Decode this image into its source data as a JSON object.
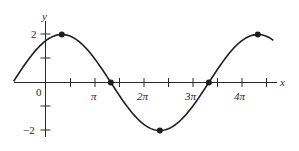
{
  "chart_data": {
    "type": "line",
    "title": "",
    "function": "y = 2 sin(x/2 + π/3)",
    "xlabel": "x",
    "ylabel": "y",
    "xlim": [
      -0.65,
      4.65
    ],
    "xlim_units": "multiples of π",
    "ylim": [
      -2.2,
      2.5
    ],
    "x_ticks": [
      0.5,
      1,
      1.5,
      2,
      2.5,
      3,
      3.5,
      4,
      4.5
    ],
    "x_tick_labels": [
      {
        "value": 0,
        "label": "0"
      },
      {
        "value": 1,
        "label": "π"
      },
      {
        "value": 2,
        "label": "2π"
      },
      {
        "value": 3,
        "label": "3π"
      },
      {
        "value": 4,
        "label": "4π"
      }
    ],
    "y_ticks": [
      -2,
      -1,
      1,
      2
    ],
    "y_tick_labels": [
      {
        "value": 2,
        "label": "2"
      },
      {
        "value": -2,
        "label": "−2"
      }
    ],
    "marked_points": [
      {
        "x_pi": 0.3333,
        "y": 2,
        "kind": "maximum"
      },
      {
        "x_pi": 1.3333,
        "y": 0,
        "kind": "zero"
      },
      {
        "x_pi": 2.3333,
        "y": -2,
        "kind": "minimum"
      },
      {
        "x_pi": 3.3333,
        "y": 0,
        "kind": "zero"
      },
      {
        "x_pi": 4.3333,
        "y": 2,
        "kind": "maximum"
      }
    ],
    "grid": false,
    "legend": null
  },
  "labels": {
    "x_axis": "x",
    "y_axis": "y",
    "origin": "0",
    "pi": "π",
    "two_pi": "2π",
    "three_pi": "3π",
    "four_pi": "4π",
    "y_pos2": "2",
    "y_neg2": "−2"
  }
}
